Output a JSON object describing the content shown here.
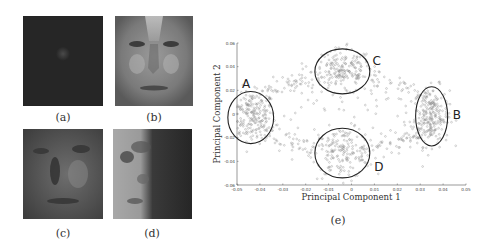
{
  "figure": {
    "panels": [
      {
        "id": "a",
        "caption": "(a)",
        "description": "dark face image, faint nose highlight"
      },
      {
        "id": "b",
        "caption": "(b)",
        "description": "bright average face image"
      },
      {
        "id": "c",
        "caption": "(c)",
        "description": "medium-dark face image"
      },
      {
        "id": "d",
        "caption": "(d)",
        "description": "side-lit face image, left half bright"
      },
      {
        "id": "e",
        "caption": "(e)",
        "description": "PCA scatter plot"
      }
    ]
  },
  "chart_data": {
    "type": "scatter",
    "title": "",
    "xlabel": "Principal Component 1",
    "ylabel": "Principal Component 2",
    "xlim": [
      -0.05,
      0.05
    ],
    "ylim": [
      -0.06,
      0.06
    ],
    "xticks": [
      "-0.05",
      "-0.04",
      "-0.03",
      "-0.02",
      "-0.01",
      "0",
      "0.01",
      "0.02",
      "0.03",
      "0.04",
      "0.05"
    ],
    "yticks": [
      "0.06",
      "0.04",
      "0.02",
      "0",
      "-0.02",
      "-0.04",
      "-0.06"
    ],
    "grid": false,
    "marker": "open-circle",
    "marker_color": "#888888",
    "clusters": [
      {
        "label": "A",
        "center": [
          -0.044,
          -0.003
        ],
        "radius": [
          0.01,
          0.022
        ],
        "label_pos": [
          -0.046,
          0.025
        ]
      },
      {
        "label": "B",
        "center": [
          0.035,
          -0.002
        ],
        "radius": [
          0.007,
          0.025
        ],
        "label_pos": [
          0.046,
          -0.001
        ]
      },
      {
        "label": "C",
        "center": [
          -0.004,
          0.036
        ],
        "radius": [
          0.012,
          0.019
        ],
        "label_pos": [
          0.011,
          0.045
        ]
      },
      {
        "label": "D",
        "center": [
          -0.004,
          -0.033
        ],
        "radius": [
          0.012,
          0.021
        ],
        "label_pos": [
          0.012,
          -0.045
        ]
      }
    ],
    "point_distribution": "ring-shaped cloud of ~900 points connecting clusters A-C-B (upper arc) and A-D-B (lower arc), sparse center"
  }
}
